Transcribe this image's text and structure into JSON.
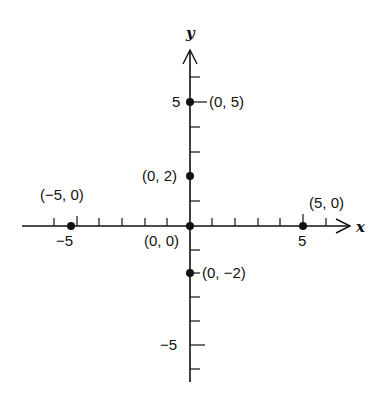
{
  "diagram": {
    "type": "coordinate-plane",
    "axes": {
      "x_label": "x",
      "y_label": "y"
    },
    "x_ticks": [
      -6,
      -5,
      -4,
      -3,
      -2,
      -1,
      1,
      2,
      3,
      4,
      5,
      6
    ],
    "y_ticks": [
      -6,
      -5,
      -4,
      -3,
      -2,
      -1,
      1,
      2,
      3,
      4,
      5,
      6
    ],
    "tick_labels": {
      "x_neg5": "−5",
      "x_pos5": "5",
      "y_pos5": "5",
      "y_neg5": "−5"
    },
    "points": [
      {
        "x": -5,
        "y": 0,
        "label": "(−5, 0)"
      },
      {
        "x": 0,
        "y": 0,
        "label": "(0, 0)"
      },
      {
        "x": 5,
        "y": 0,
        "label": "(5, 0)"
      },
      {
        "x": 0,
        "y": 5,
        "label": "(0, 5)"
      },
      {
        "x": 0,
        "y": 2,
        "label": "(0, 2)"
      },
      {
        "x": 0,
        "y": -2,
        "label": "(0, −2)"
      }
    ],
    "colors": {
      "ink": "#111111",
      "background": "#ffffff"
    }
  }
}
